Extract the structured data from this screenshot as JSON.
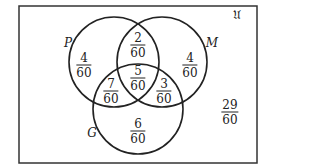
{
  "diagram": {
    "type": "venn-3",
    "universe_label": "𝔘",
    "sets": [
      {
        "id": "P",
        "label": "P"
      },
      {
        "id": "M",
        "label": "M"
      },
      {
        "id": "G",
        "label": "G"
      }
    ],
    "regions": {
      "P_only": {
        "num": "4",
        "den": "60"
      },
      "M_only": {
        "num": "4",
        "den": "60"
      },
      "G_only": {
        "num": "6",
        "den": "60"
      },
      "P_M_only": {
        "num": "2",
        "den": "60"
      },
      "P_G_only": {
        "num": "7",
        "den": "60"
      },
      "M_G_only": {
        "num": "3",
        "den": "60"
      },
      "P_M_G": {
        "num": "5",
        "den": "60"
      },
      "outside": {
        "num": "29",
        "den": "60"
      }
    },
    "colors": {
      "stroke": "#222222",
      "background": "#ffffff"
    }
  }
}
